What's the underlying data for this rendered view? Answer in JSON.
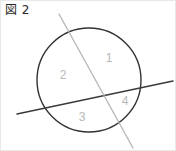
{
  "figure": {
    "caption": "図 2",
    "background_color": "#ffffff",
    "border_color": "#e8e8e8"
  },
  "diagram": {
    "type": "geometry-figure",
    "circle": {
      "name": "circle",
      "center_x": 88,
      "center_y": 79,
      "radius": 52,
      "stroke_color": "#333333",
      "stroke_width": 1.4,
      "fill": "none"
    },
    "lines": [
      {
        "name": "dark-secant-line",
        "x1": 16,
        "y1": 113,
        "x2": 172,
        "y2": 80,
        "stroke_color": "#3a3a3a",
        "stroke_width": 1.4
      },
      {
        "name": "gray-secant-line",
        "x1": 58,
        "y1": 13,
        "x2": 132,
        "y2": 147,
        "stroke_color": "#b5b5b5",
        "stroke_width": 1.3
      }
    ],
    "intersection_point": {
      "name": "lines-intersection",
      "x": 100,
      "y": 90
    },
    "region_labels": [
      {
        "text": "1",
        "x": 108,
        "y": 58,
        "color": "#b8b8b8"
      },
      {
        "text": "2",
        "x": 62,
        "y": 75,
        "color": "#b8b8b8"
      },
      {
        "text": "3",
        "x": 81,
        "y": 117,
        "color": "#b8b8b8"
      },
      {
        "text": "4",
        "x": 124,
        "y": 101,
        "color": "#b8b8b8"
      }
    ]
  }
}
